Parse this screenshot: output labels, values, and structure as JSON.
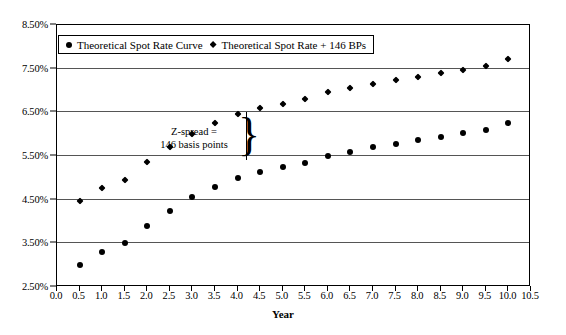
{
  "chart_data": {
    "type": "scatter",
    "title": "",
    "xlabel": "Year",
    "ylabel": "",
    "xlim": [
      0.0,
      10.5
    ],
    "ylim": [
      2.5,
      8.5
    ],
    "grid": true,
    "legend_position": "top-left",
    "x_ticks": [
      "0.0",
      "0.5",
      "1.0",
      "1.5",
      "2.0",
      "2.5",
      "3.0",
      "3.5",
      "4.0",
      "4.5",
      "5.0",
      "5.5",
      "6.0",
      "6.5",
      "7.0",
      "7.5",
      "8.0",
      "8.5",
      "9.0",
      "9.5",
      "10.0",
      "10.5"
    ],
    "x_tick_values": [
      0.0,
      0.5,
      1.0,
      1.5,
      2.0,
      2.5,
      3.0,
      3.5,
      4.0,
      4.5,
      5.0,
      5.5,
      6.0,
      6.5,
      7.0,
      7.5,
      8.0,
      8.5,
      9.0,
      9.5,
      10.0,
      10.5
    ],
    "y_ticks": [
      "2.50%",
      "3.50%",
      "4.50%",
      "5.50%",
      "6.50%",
      "7.50%",
      "8.50%"
    ],
    "y_tick_values": [
      2.5,
      3.5,
      4.5,
      5.5,
      6.5,
      7.5,
      8.5
    ],
    "x": [
      0.5,
      1.0,
      1.5,
      2.0,
      2.5,
      3.0,
      3.5,
      4.0,
      4.5,
      5.0,
      5.5,
      6.0,
      6.5,
      7.0,
      7.5,
      8.0,
      8.5,
      9.0,
      9.5,
      10.0
    ],
    "series": [
      {
        "name": "Theoretical Spot Rate Curve",
        "marker": "circle",
        "color": "#000000",
        "values": [
          3.0,
          3.3,
          3.5,
          3.9,
          4.25,
          4.55,
          4.8,
          5.0,
          5.14,
          5.24,
          5.34,
          5.5,
          5.6,
          5.7,
          5.78,
          5.86,
          5.94,
          6.02,
          6.1,
          6.26
        ]
      },
      {
        "name": "Theoretical Spot Rate + 146 BPs",
        "marker": "diamond",
        "color": "#000000",
        "values": [
          4.46,
          4.76,
          4.96,
          5.36,
          5.71,
          6.01,
          6.26,
          6.46,
          6.6,
          6.7,
          6.8,
          6.96,
          7.06,
          7.16,
          7.24,
          7.32,
          7.4,
          7.48,
          7.56,
          7.72
        ]
      }
    ],
    "annotations": [
      {
        "name": "z-spread-callout",
        "line1": "Z-spread =",
        "line2": "146 basis points",
        "brace_glyph": "}",
        "x": 4.0,
        "y_top": 6.5,
        "y_bottom": 5.5
      }
    ]
  },
  "legend": {
    "entries": [
      {
        "label": "Theoretical Spot Rate Curve",
        "marker": "circle-marker-icon"
      },
      {
        "label": "Theoretical Spot Rate + 146 BPs",
        "marker": "diamond-marker-icon"
      }
    ]
  },
  "axes": {
    "x_title": "Year"
  }
}
